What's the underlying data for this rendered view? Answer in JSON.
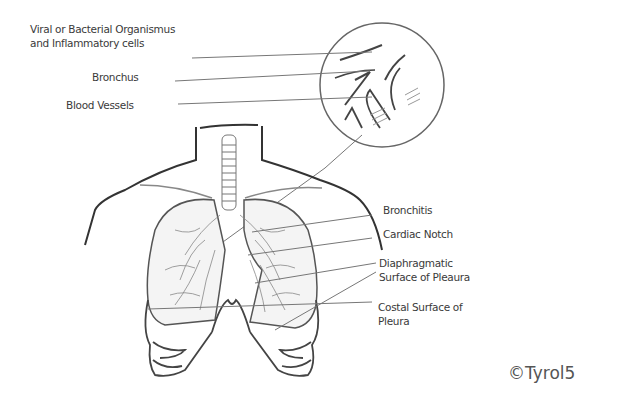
{
  "diagram": {
    "labels_top": [
      {
        "id": "organisms",
        "lines": [
          "Viral or Bacterial Organismus",
          "and Inflammatory cells"
        ]
      },
      {
        "id": "bronchus",
        "lines": [
          "Bronchus"
        ]
      },
      {
        "id": "blood-vessels",
        "lines": [
          "Blood Vessels"
        ]
      }
    ],
    "labels_right": [
      {
        "id": "bronchitis",
        "lines": [
          "Bronchitis"
        ]
      },
      {
        "id": "cardiac-notch",
        "lines": [
          "Cardiac Notch"
        ]
      },
      {
        "id": "diaphragmatic",
        "lines": [
          "Diaphragmatic",
          "Surface of Pleaura"
        ]
      },
      {
        "id": "costal",
        "lines": [
          "Costal Surface of",
          "Pleura"
        ]
      }
    ],
    "copyright": "©Tyrol5",
    "colors": {
      "line": "#4a4a4a",
      "text": "#3a3a3a",
      "background": "#ffffff"
    }
  }
}
